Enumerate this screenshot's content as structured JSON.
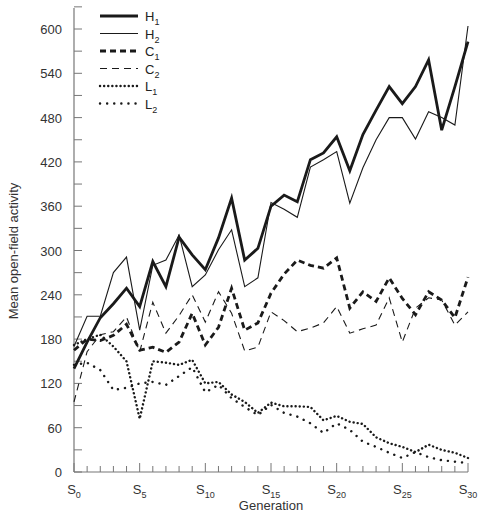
{
  "chart_data": {
    "type": "line",
    "title": "",
    "xlabel": "Generation",
    "ylabel": "Mean open-field activity",
    "ylim": [
      0,
      600
    ],
    "xlim": [
      0,
      30
    ],
    "grid": false,
    "legend_position": "upper-left",
    "yticks": [
      0,
      60,
      120,
      180,
      240,
      300,
      360,
      420,
      480,
      540,
      600
    ],
    "yminor_step": 30,
    "xticks": [
      {
        "g": 0,
        "base": "S",
        "sub": "0"
      },
      {
        "g": 5,
        "base": "S",
        "sub": "5"
      },
      {
        "g": 10,
        "base": "S",
        "sub": "10"
      },
      {
        "g": 15,
        "base": "S",
        "sub": "15"
      },
      {
        "g": 20,
        "base": "S",
        "sub": "20"
      },
      {
        "g": 25,
        "base": "S",
        "sub": "25"
      },
      {
        "g": 30,
        "base": "S",
        "sub": "30"
      }
    ],
    "x": [
      0,
      1,
      2,
      3,
      4,
      5,
      6,
      7,
      8,
      9,
      10,
      11,
      12,
      13,
      14,
      15,
      16,
      17,
      18,
      19,
      20,
      21,
      22,
      23,
      24,
      25,
      26,
      27,
      28,
      29,
      30
    ],
    "series": [
      {
        "name": "H1",
        "base": "H",
        "sub": "1",
        "style": "thick-solid",
        "values": [
          140,
          176,
          209,
          228,
          249,
          224,
          285,
          251,
          318,
          294,
          274,
          317,
          371,
          287,
          303,
          360,
          375,
          366,
          423,
          432,
          454,
          408,
          457,
          490,
          522,
          499,
          522,
          558,
          463,
          522,
          583
        ]
      },
      {
        "name": "H2",
        "base": "H",
        "sub": "2",
        "style": "thin-solid",
        "values": [
          170,
          211,
          211,
          270,
          291,
          192,
          280,
          287,
          321,
          251,
          267,
          301,
          328,
          251,
          263,
          365,
          356,
          345,
          413,
          423,
          434,
          364,
          412,
          450,
          480,
          480,
          451,
          488,
          480,
          470,
          604
        ]
      },
      {
        "name": "C1",
        "base": "C",
        "sub": "1",
        "style": "thick-dashed",
        "values": [
          165,
          180,
          178,
          185,
          200,
          165,
          169,
          162,
          176,
          215,
          172,
          196,
          249,
          192,
          202,
          242,
          268,
          287,
          280,
          276,
          290,
          222,
          244,
          231,
          263,
          235,
          213,
          244,
          233,
          209,
          264
        ]
      },
      {
        "name": "C2",
        "base": "C",
        "sub": "2",
        "style": "thin-dashed",
        "values": [
          95,
          163,
          186,
          190,
          210,
          163,
          230,
          188,
          212,
          240,
          203,
          244,
          215,
          164,
          169,
          217,
          205,
          190,
          195,
          202,
          224,
          188,
          194,
          199,
          236,
          176,
          222,
          236,
          233,
          199,
          217
        ]
      },
      {
        "name": "L1",
        "base": "L",
        "sub": "1",
        "style": "dense-dotted",
        "values": [
          172,
          180,
          186,
          170,
          150,
          72,
          150,
          148,
          145,
          152,
          120,
          122,
          105,
          95,
          80,
          94,
          89,
          89,
          88,
          70,
          76,
          68,
          65,
          47,
          39,
          34,
          27,
          37,
          30,
          26,
          19
        ]
      },
      {
        "name": "L2",
        "base": "L",
        "sub": "2",
        "style": "sparse-dotted",
        "values": [
          145,
          148,
          138,
          111,
          114,
          120,
          122,
          118,
          130,
          142,
          108,
          118,
          100,
          88,
          77,
          91,
          80,
          75,
          66,
          53,
          66,
          57,
          41,
          34,
          26,
          19,
          27,
          20,
          16,
          14,
          12
        ]
      }
    ]
  },
  "legend": {
    "items": [
      {
        "base": "H",
        "sub": "1"
      },
      {
        "base": "H",
        "sub": "2"
      },
      {
        "base": "C",
        "sub": "1"
      },
      {
        "base": "C",
        "sub": "2"
      },
      {
        "base": "L",
        "sub": "1"
      },
      {
        "base": "L",
        "sub": "2"
      }
    ]
  },
  "colors": {
    "axis": "#777777",
    "line": "#1a1a1a",
    "text": "#333333",
    "background": "#ffffff"
  }
}
